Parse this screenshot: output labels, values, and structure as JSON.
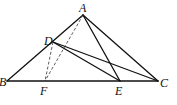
{
  "figure": {
    "type": "geometry-triangle",
    "points": {
      "A": {
        "label": "A",
        "x": 83,
        "y": 15
      },
      "B": {
        "label": "B",
        "x": 7,
        "y": 81
      },
      "C": {
        "label": "C",
        "x": 158,
        "y": 81
      },
      "D": {
        "label": "D",
        "x": 53,
        "y": 42
      },
      "E": {
        "label": "E",
        "x": 120,
        "y": 81
      },
      "F": {
        "label": "F",
        "x": 45,
        "y": 81
      }
    },
    "segments_solid": [
      "AB",
      "AC",
      "BC",
      "AE",
      "DE",
      "DC"
    ],
    "segments_dashed": [
      "DF",
      "AF"
    ],
    "line_color": "#111111"
  }
}
